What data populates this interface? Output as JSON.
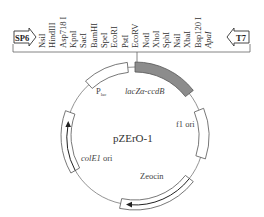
{
  "diagram": {
    "plasmid_name": "pZErO-1",
    "promoters": {
      "left": "SP6",
      "right": "T7"
    },
    "mcs_sites": [
      "NsiI",
      "HindIII",
      "Asp718 I",
      "KpnI",
      "SacI",
      "BamHI",
      "SpeI",
      "EcoRI",
      "PstI",
      "EcoRV",
      "NotI",
      "XhoI",
      "SphI",
      "NsiI",
      "XbaI",
      "Bsp120 I",
      "ApaI"
    ],
    "features": {
      "plac": {
        "label": "P",
        "sub": "lac"
      },
      "lacz": {
        "label": "lacZα-ccdB"
      },
      "f1": {
        "label": "f1 ori"
      },
      "zeocin": {
        "label": "Zeocin"
      },
      "cole1": {
        "label_italic": "colE1",
        "label_rest": " ori"
      }
    },
    "colors": {
      "line": "#555555",
      "lacz_fill": "#8c8c8c",
      "box_fill": "#ffffff",
      "text": "#333333"
    }
  }
}
